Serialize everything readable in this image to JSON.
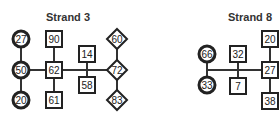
{
  "diagrams": [
    {
      "title": "Strand 3",
      "title_pos": [
        68,
        21
      ],
      "nodes": [
        {
          "label": "27",
          "shape": "circle",
          "x": 21,
          "y": 39
        },
        {
          "label": "50",
          "shape": "circle",
          "x": 21,
          "y": 70
        },
        {
          "label": "20",
          "shape": "circle",
          "x": 21,
          "y": 100
        },
        {
          "label": "90",
          "shape": "square",
          "x": 54,
          "y": 39
        },
        {
          "label": "62",
          "shape": "square",
          "x": 54,
          "y": 70
        },
        {
          "label": "61",
          "shape": "square",
          "x": 54,
          "y": 100
        },
        {
          "label": "14",
          "shape": "square",
          "x": 87,
          "y": 54
        },
        {
          "label": "58",
          "shape": "square",
          "x": 87,
          "y": 85
        },
        {
          "label": "60",
          "shape": "diamond",
          "x": 117,
          "y": 39
        },
        {
          "label": "72",
          "shape": "diamond",
          "x": 117,
          "y": 70
        },
        {
          "label": "83",
          "shape": "diamond",
          "x": 117,
          "y": 100
        }
      ],
      "lines": [
        [
          21,
          39,
          21,
          100
        ],
        [
          21,
          70,
          117,
          70
        ],
        [
          54,
          39,
          54,
          100
        ],
        [
          87,
          54,
          87,
          85
        ],
        [
          117,
          39,
          117,
          100
        ]
      ]
    },
    {
      "title": "Strand 8",
      "title_pos": [
        250,
        21
      ],
      "nodes": [
        {
          "label": "66",
          "shape": "circle",
          "x": 207,
          "y": 54
        },
        {
          "label": "33",
          "shape": "circle",
          "x": 207,
          "y": 85
        },
        {
          "label": "32",
          "shape": "square",
          "x": 238,
          "y": 54
        },
        {
          "label": "7",
          "shape": "square",
          "x": 238,
          "y": 86
        },
        {
          "label": "20",
          "shape": "square",
          "x": 270,
          "y": 39
        },
        {
          "label": "27",
          "shape": "square",
          "x": 270,
          "y": 70
        },
        {
          "label": "38",
          "shape": "square",
          "x": 270,
          "y": 101
        }
      ],
      "lines": [
        [
          207,
          54,
          207,
          85
        ],
        [
          207,
          70,
          270,
          70
        ],
        [
          238,
          54,
          238,
          86
        ],
        [
          270,
          39,
          270,
          101
        ]
      ]
    }
  ]
}
